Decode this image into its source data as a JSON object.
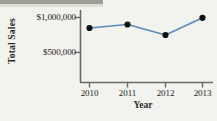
{
  "figure": {
    "background_color": "#f2f2ee",
    "axis_color": "#6b6b63",
    "text_color": "#222222"
  },
  "chart_data": {
    "type": "line",
    "title": "",
    "xlabel": "Year",
    "ylabel": "Total Sales",
    "categories": [
      "2010",
      "2011",
      "2012",
      "2013"
    ],
    "x": [
      2010,
      2011,
      2012,
      2013
    ],
    "values": [
      850000,
      900000,
      750000,
      995000
    ],
    "series": [
      {
        "name": "Total Sales",
        "values": [
          850000,
          900000,
          750000,
          995000
        ],
        "line_color": "#5b8cba",
        "marker_color": "#111111",
        "marker": "circle"
      }
    ],
    "ylim": [
      0,
      1120000
    ],
    "xlim": [
      2009.55,
      2013.45
    ],
    "ytick_values": [
      500000,
      1000000
    ],
    "ytick_labels": [
      "$500,000",
      "$1,000,000"
    ],
    "xtick_labels": [
      "2010",
      "2011",
      "2012",
      "2013"
    ],
    "grid": false,
    "legend": false,
    "legend_position": "none"
  },
  "axes": {
    "y_title": "Total Sales",
    "x_title": "Year",
    "y_labels": [
      "$1,000,000",
      "$500,000"
    ],
    "x_labels": [
      "2010",
      "2011",
      "2012",
      "2013"
    ]
  }
}
